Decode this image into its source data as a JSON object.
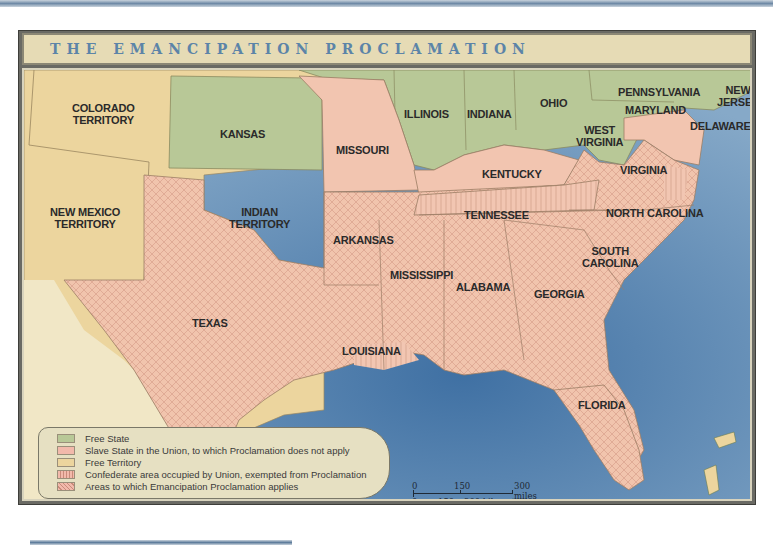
{
  "title": "THE EMANCIPATION PROCLAMATION",
  "colors": {
    "free_state": "#b8c897",
    "slave_state_union": "#f2c5b0",
    "free_territory": "#ecd59e",
    "confederate_occupied": "#f2c5b0",
    "proclamation_applies": "#f0bfa8",
    "ocean": "#5f8db8",
    "title_text": "#5c84a8"
  },
  "regions": {
    "colorado": "COLORADO TERRITORY",
    "colorado_l1": "COLORADO",
    "colorado_l2": "TERRITORY",
    "kansas": "KANSAS",
    "new_mexico_l1": "NEW MEXICO",
    "new_mexico_l2": "TERRITORY",
    "indian_l1": "INDIAN",
    "indian_l2": "TERRITORY",
    "texas": "TEXAS",
    "missouri": "MISSOURI",
    "illinois": "ILLINOIS",
    "indiana": "INDIANA",
    "ohio": "OHIO",
    "pennsylvania": "PENNSYLVANIA",
    "new_jersey_l1": "NEW",
    "new_jersey_l2": "JERSEY",
    "maryland": "MARYLAND",
    "delaware": "DELAWARE",
    "west_virginia_l1": "WEST",
    "west_virginia_l2": "VIRGINIA",
    "virginia": "VIRGINIA",
    "kentucky": "KENTUCKY",
    "tennessee": "TENNESSEE",
    "north_carolina": "NORTH CAROLINA",
    "south_carolina_l1": "SOUTH",
    "south_carolina_l2": "CAROLINA",
    "arkansas": "ARKANSAS",
    "mississippi": "MISSISSIPPI",
    "alabama": "ALABAMA",
    "georgia": "GEORGIA",
    "louisiana": "LOUISIANA",
    "florida": "FLORIDA"
  },
  "legend": [
    {
      "label": "Free State",
      "pattern": "solid-green"
    },
    {
      "label": "Slave State in the Union, to which Proclamation does not apply",
      "pattern": "solid-pink"
    },
    {
      "label": "Free Territory",
      "pattern": "solid-tan"
    },
    {
      "label": "Confederate area occupied by Union, exempted from Proclamation",
      "pattern": "vertical-lines"
    },
    {
      "label": "Areas to which Emancipation Proclamation applies",
      "pattern": "crosshatch"
    }
  ],
  "scale": {
    "miles_ticks": [
      "0",
      "150",
      "300 miles"
    ],
    "km_ticks": [
      "0",
      "150",
      "300 kilometers"
    ]
  }
}
